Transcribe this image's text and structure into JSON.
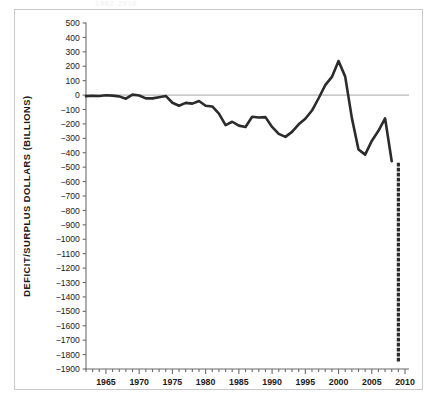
{
  "figure": {
    "background_color": "#ffffff",
    "frame_color": "#c8c8c8",
    "title_remnant": "1962-2010"
  },
  "chart_data": {
    "type": "line",
    "title": "",
    "subtitle": "",
    "xlabel": "",
    "ylabel": "DEFICIT/SURPLUS DOLLARS (BILLIONS)",
    "xlim": [
      1962,
      2010.6
    ],
    "ylim": [
      -1900,
      500
    ],
    "y_tick_step": 100,
    "x_major_tick_step": 5,
    "x_minor_tick_step": 1,
    "grid": false,
    "legend": "none",
    "zero_line": 0,
    "zero_line_color": "#8c8c8c",
    "line_color": "#2b2b2b",
    "line_width": 2.6,
    "xticks": [
      1965,
      1970,
      1975,
      1980,
      1985,
      1990,
      1995,
      2000,
      2005,
      2010
    ],
    "xtick_labels": [
      "1965",
      "1970",
      "1975",
      "1980",
      "1985",
      "1990",
      "1995",
      "2000",
      "2005",
      "2010"
    ],
    "yticks": [
      500,
      400,
      300,
      200,
      100,
      0,
      -100,
      -200,
      -300,
      -400,
      -500,
      -600,
      -700,
      -800,
      -900,
      -1000,
      -1100,
      -1200,
      -1300,
      -1400,
      -1500,
      -1600,
      -1700,
      -1800,
      -1900
    ],
    "ytick_labels": [
      "500",
      "400",
      "300",
      "200",
      "100",
      "0",
      "−100",
      "−200",
      "−300",
      "−400",
      "−500",
      "−600",
      "−700",
      "−800",
      "−900",
      "−1000",
      "−1100",
      "−1200",
      "−1300",
      "−1400",
      "−1500",
      "−1600",
      "−1700",
      "−1800",
      "−1900"
    ],
    "series": [
      {
        "name": "Federal deficit/surplus",
        "style": "solid",
        "x": [
          1962,
          1963,
          1964,
          1965,
          1966,
          1967,
          1968,
          1969,
          1970,
          1971,
          1972,
          1973,
          1974,
          1975,
          1976,
          1977,
          1978,
          1979,
          1980,
          1981,
          1982,
          1983,
          1984,
          1985,
          1986,
          1987,
          1988,
          1989,
          1990,
          1991,
          1992,
          1993,
          1994,
          1995,
          1996,
          1997,
          1998,
          1999,
          2000,
          2001,
          2002,
          2003,
          2004,
          2005,
          2006,
          2007,
          2008
        ],
        "values": [
          -7,
          -5,
          -6,
          -1,
          -4,
          -9,
          -25,
          3,
          -3,
          -23,
          -23,
          -15,
          -6,
          -53,
          -74,
          -54,
          -59,
          -41,
          -74,
          -79,
          -128,
          -208,
          -185,
          -212,
          -221,
          -150,
          -155,
          -153,
          -221,
          -269,
          -290,
          -255,
          -203,
          -164,
          -107,
          -22,
          69,
          126,
          236,
          128,
          -158,
          -378,
          -413,
          -318,
          -248,
          -161,
          -459
        ]
      },
      {
        "name": "Projected 2009 deficit",
        "style": "dotted",
        "x": [
          2009,
          2009
        ],
        "values": [
          -480,
          -1850
        ]
      }
    ],
    "annotations": []
  }
}
